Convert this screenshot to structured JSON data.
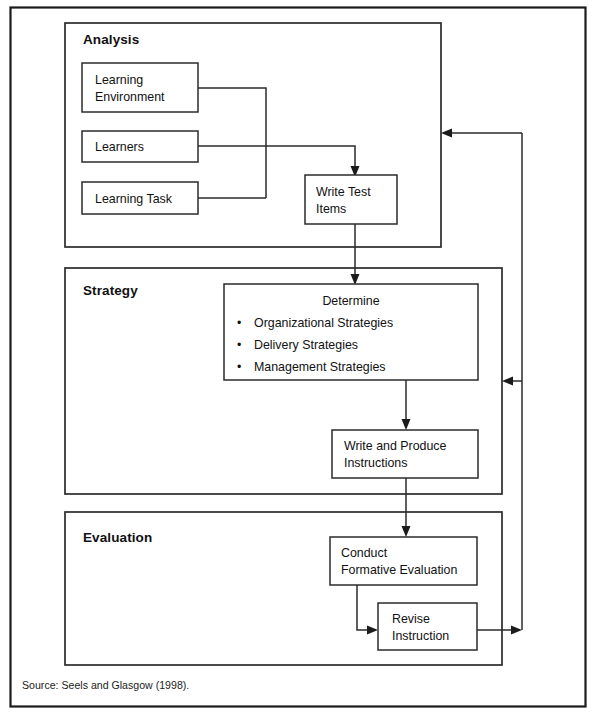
{
  "figure": {
    "outer_frame": {
      "name": "figure-border"
    },
    "source_note": "Source: Seels and Glasgow (1998).",
    "colors": {
      "background": "#ffffff",
      "line": "#2b2b2b",
      "frame": "#1b1b1b",
      "text": "#111111"
    }
  },
  "sections": [
    {
      "id": "analysis",
      "title": "Analysis"
    },
    {
      "id": "strategy",
      "title": "Strategy"
    },
    {
      "id": "evaluation",
      "title": "Evaluation"
    }
  ],
  "nodes": {
    "learning_environment": {
      "lines": [
        "Learning",
        "Environment"
      ]
    },
    "learners": {
      "lines": [
        "Learners"
      ]
    },
    "learning_task": {
      "lines": [
        "Learning Task"
      ]
    },
    "write_test_items": {
      "lines": [
        "Write Test",
        "Items"
      ]
    },
    "determine": {
      "heading": "Determine",
      "bullets": [
        "Organizational Strategies",
        "Delivery Strategies",
        "Management Strategies"
      ],
      "bullet_glyph": "•"
    },
    "write_and_produce": {
      "lines": [
        "Write and Produce",
        "Instructions"
      ]
    },
    "conduct_formative": {
      "lines": [
        "Conduct",
        "Formative Evaluation"
      ]
    },
    "revise_instruction": {
      "lines": [
        "Revise",
        "Instruction"
      ]
    }
  },
  "connectors": [
    {
      "id": "env-to-bus",
      "from": "learning_environment",
      "to": "write_test_items",
      "arrow": false
    },
    {
      "id": "task-to-bus",
      "from": "learning_task",
      "to": "write_test_items",
      "arrow": false
    },
    {
      "id": "learners-to-write",
      "from": "learners",
      "to": "write_test_items",
      "arrow": true
    },
    {
      "id": "write-to-determine",
      "from": "write_test_items",
      "to": "determine",
      "arrow": true
    },
    {
      "id": "determine-to-wp",
      "from": "determine",
      "to": "write_and_produce",
      "arrow": true
    },
    {
      "id": "wp-to-conduct",
      "from": "write_and_produce",
      "to": "conduct_formative",
      "arrow": true
    },
    {
      "id": "conduct-to-revise",
      "from": "conduct_formative",
      "to": "revise_instruction",
      "arrow": true
    },
    {
      "id": "revise-to-bus",
      "from": "revise_instruction",
      "to": "feedback_bus",
      "arrow": true
    },
    {
      "id": "feedback-to-analysis",
      "from": "feedback_bus",
      "to": "analysis",
      "arrow": true
    },
    {
      "id": "feedback-to-strategy",
      "from": "feedback_bus",
      "to": "strategy",
      "arrow": true
    }
  ]
}
